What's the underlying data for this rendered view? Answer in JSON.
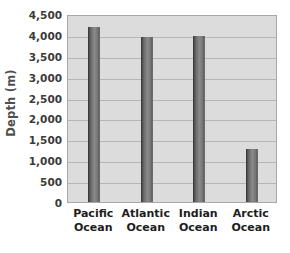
{
  "chart_data": {
    "type": "bar",
    "title": "",
    "xlabel": "",
    "ylabel": "Depth (m)",
    "categories": [
      "Pacific Ocean",
      "Atlantic Ocean",
      "Indian Ocean",
      "Arctic Ocean"
    ],
    "category_lines": [
      [
        "Pacific",
        "Ocean"
      ],
      [
        "Atlantic",
        "Ocean"
      ],
      [
        "Indian",
        "Ocean"
      ],
      [
        "Arctic",
        "Ocean"
      ]
    ],
    "values": [
      4200,
      3950,
      3980,
      1280
    ],
    "ylim": [
      0,
      4500
    ],
    "ytick_step": 500,
    "ytick_labels": [
      "4,500",
      "4,000",
      "3,500",
      "3,000",
      "2,500",
      "2,000",
      "1,500",
      "1,000",
      "500",
      "0"
    ],
    "ytick_values": [
      4500,
      4000,
      3500,
      3000,
      2500,
      2000,
      1500,
      1000,
      500,
      0
    ],
    "grid": true,
    "legend": false,
    "legend_position": "none",
    "colors": {
      "plot_background": "#dcdcdc",
      "gridline": "#b6b6b6",
      "plot_border": "#a8a8a8",
      "bar_dark": "#4a4a4a",
      "bar_light": "#8a8a8a",
      "axis_title_text": "#4f4f4f",
      "tick_text": "#3a3a3a",
      "category_text": "#1d1d1d",
      "page_background": "#ffffff"
    }
  }
}
